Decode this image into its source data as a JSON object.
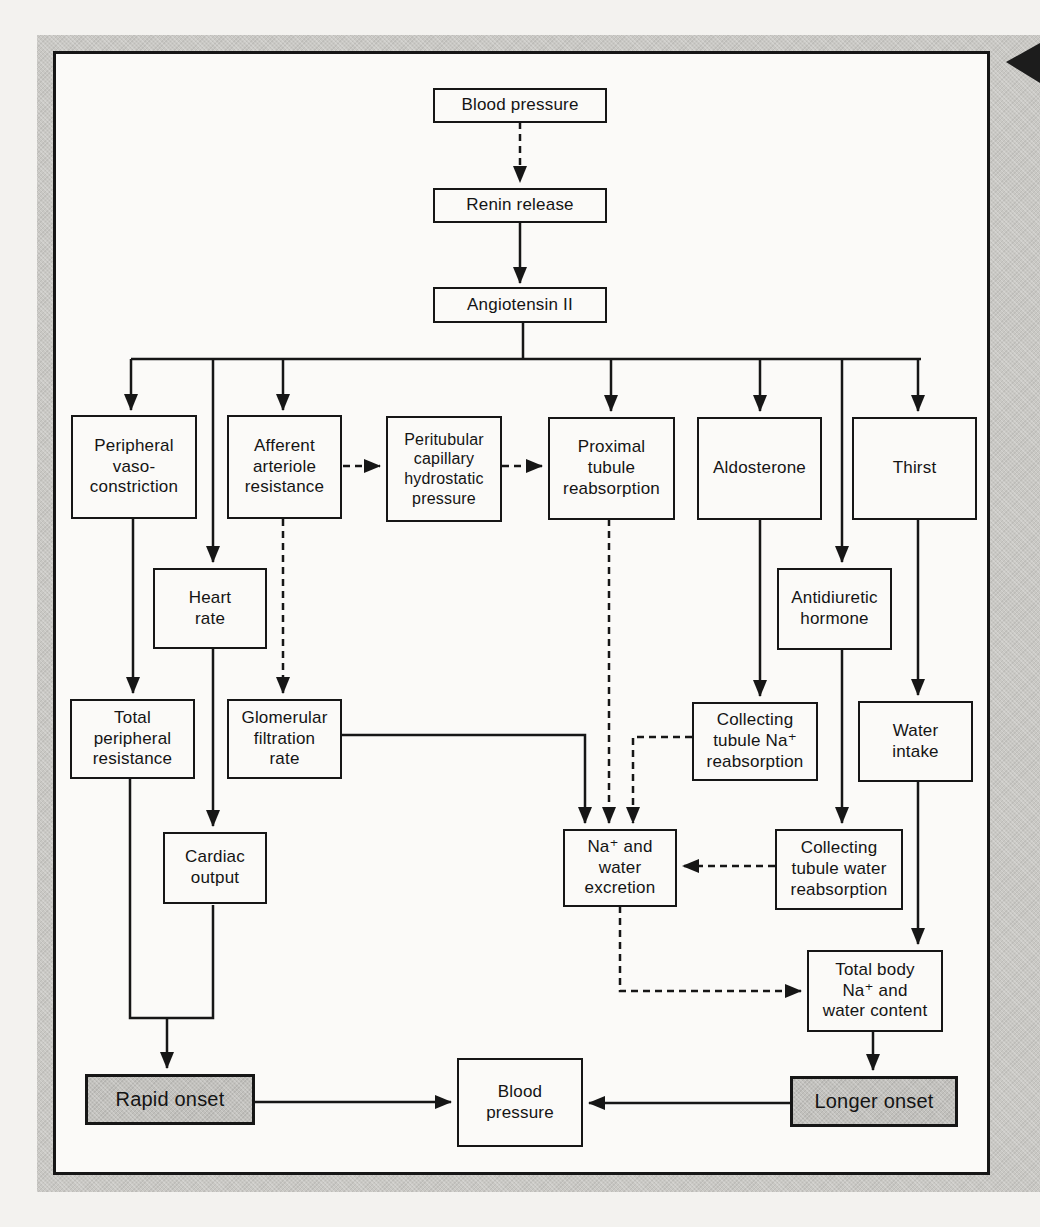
{
  "diagram": {
    "description_colors": {
      "ink": "#161616",
      "panel_bg": "#fbfaf8",
      "frame_gray": "#c9c8c4",
      "shaded_box_gray": "#c2c1bd",
      "page_bg": "#f3f2ef"
    },
    "nodes": {
      "bp_top": {
        "label": "Blood pressure"
      },
      "renin_release": {
        "label": "Renin release"
      },
      "angiotensin_ii": {
        "label": "Angiotensin II"
      },
      "peripheral_vasoconstriction": {
        "label": "Peripheral\nvaso-\nconstriction"
      },
      "afferent_arteriole_resistance": {
        "label": "Afferent\narteriole\nresistance"
      },
      "peritubular_capillary_hydrostatic_pressure": {
        "label": "Peritubular\ncapillary\nhydrostatic\npressure"
      },
      "proximal_tubule_reabsorption": {
        "label": "Proximal\ntubule\nreabsorption"
      },
      "aldosterone": {
        "label": "Aldosterone"
      },
      "thirst": {
        "label": "Thirst"
      },
      "heart_rate": {
        "label": "Heart\nrate"
      },
      "antidiuretic_hormone": {
        "label": "Antidiuretic\nhormone"
      },
      "total_peripheral_resistance": {
        "label": "Total\nperipheral\nresistance"
      },
      "glomerular_filtration_rate": {
        "label": "Glomerular\nfiltration\nrate"
      },
      "collecting_tubule_na_reabsorption": {
        "label": "Collecting\ntubule Na⁺\nreabsorption"
      },
      "water_intake": {
        "label": "Water\nintake"
      },
      "cardiac_output": {
        "label": "Cardiac\noutput"
      },
      "na_water_excretion": {
        "label": "Na⁺ and\nwater\nexcretion"
      },
      "collecting_tubule_water_reabsorption": {
        "label": "Collecting\ntubule water\nreabsorption"
      },
      "total_body_na_water_content": {
        "label": "Total body\nNa⁺ and\nwater content"
      },
      "rapid_onset": {
        "label": "Rapid onset"
      },
      "bp_bottom": {
        "label": "Blood\npressure"
      },
      "longer_onset": {
        "label": "Longer onset"
      }
    },
    "edges": [
      {
        "from": "Blood pressure",
        "to": "Renin release",
        "style": "dashed"
      },
      {
        "from": "Renin release",
        "to": "Angiotensin II",
        "style": "solid"
      },
      {
        "from": "Angiotensin II",
        "to": "Peripheral vaso-constriction",
        "style": "solid"
      },
      {
        "from": "Angiotensin II",
        "to": "Heart rate",
        "style": "solid"
      },
      {
        "from": "Angiotensin II",
        "to": "Afferent arteriole resistance",
        "style": "solid"
      },
      {
        "from": "Angiotensin II",
        "to": "Proximal tubule reabsorption",
        "style": "solid"
      },
      {
        "from": "Angiotensin II",
        "to": "Aldosterone",
        "style": "solid"
      },
      {
        "from": "Angiotensin II",
        "to": "Antidiuretic hormone",
        "style": "solid"
      },
      {
        "from": "Angiotensin II",
        "to": "Thirst",
        "style": "solid"
      },
      {
        "from": "Afferent arteriole resistance",
        "to": "Peritubular capillary hydrostatic pressure",
        "style": "dashed"
      },
      {
        "from": "Peritubular capillary hydrostatic pressure",
        "to": "Proximal tubule reabsorption",
        "style": "dashed"
      },
      {
        "from": "Afferent arteriole resistance",
        "to": "Glomerular filtration rate",
        "style": "dashed"
      },
      {
        "from": "Peripheral vaso-constriction",
        "to": "Total peripheral resistance",
        "style": "solid"
      },
      {
        "from": "Heart rate",
        "to": "Cardiac output",
        "style": "solid"
      },
      {
        "from": "Aldosterone",
        "to": "Collecting tubule Na⁺ reabsorption",
        "style": "solid"
      },
      {
        "from": "Thirst",
        "to": "Water intake",
        "style": "solid"
      },
      {
        "from": "Antidiuretic hormone",
        "to": "Collecting tubule water reabsorption",
        "style": "solid"
      },
      {
        "from": "Glomerular filtration rate",
        "to": "Na⁺ and water excretion",
        "style": "solid"
      },
      {
        "from": "Proximal tubule reabsorption",
        "to": "Na⁺ and water excretion",
        "style": "dashed"
      },
      {
        "from": "Collecting tubule Na⁺ reabsorption",
        "to": "Na⁺ and water excretion",
        "style": "dashed"
      },
      {
        "from": "Collecting tubule water reabsorption",
        "to": "Na⁺ and water excretion",
        "style": "dashed"
      },
      {
        "from": "Na⁺ and water excretion",
        "to": "Total body Na⁺ and water content",
        "style": "dashed"
      },
      {
        "from": "Water intake",
        "to": "Total body Na⁺ and water content",
        "style": "solid"
      },
      {
        "from": "Total peripheral resistance",
        "to": "Rapid onset",
        "style": "solid"
      },
      {
        "from": "Cardiac output",
        "to": "Rapid onset",
        "style": "solid"
      },
      {
        "from": "Rapid onset",
        "to": "Blood pressure",
        "style": "solid"
      },
      {
        "from": "Total body Na⁺ and water content",
        "to": "Longer onset",
        "style": "solid"
      },
      {
        "from": "Longer onset",
        "to": "Blood pressure",
        "style": "solid"
      }
    ],
    "decorations": {
      "margin_arrow_icon": "black-left-triangle"
    }
  }
}
